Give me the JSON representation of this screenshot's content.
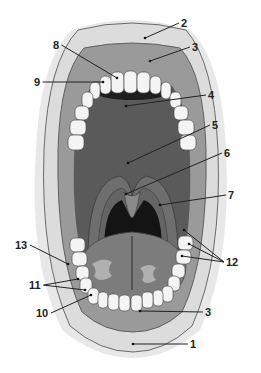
{
  "diagram": {
    "labels": [
      {
        "id": "1",
        "text": "1",
        "x": 190,
        "y": 348,
        "target_x": 133,
        "target_y": 344
      },
      {
        "id": "2",
        "text": "2",
        "x": 181,
        "y": 27,
        "target_x": 145,
        "target_y": 38
      },
      {
        "id": "3a",
        "text": "3",
        "x": 192,
        "y": 51,
        "target_x": 150,
        "target_y": 61
      },
      {
        "id": "3b",
        "text": "3",
        "x": 205,
        "y": 316,
        "target_x": 140,
        "target_y": 311
      },
      {
        "id": "4",
        "text": "4",
        "x": 208,
        "y": 99,
        "target_x": 126,
        "target_y": 106
      },
      {
        "id": "5",
        "text": "5",
        "x": 212,
        "y": 129,
        "target_x": 128,
        "target_y": 163
      },
      {
        "id": "6",
        "text": "6",
        "x": 224,
        "y": 157,
        "target_x": 126,
        "target_y": 194
      },
      {
        "id": "7",
        "text": "7",
        "x": 228,
        "y": 199,
        "target_x": 160,
        "target_y": 205
      },
      {
        "id": "8",
        "text": "8",
        "x": 53,
        "y": 49,
        "target_x": 117,
        "target_y": 78
      },
      {
        "id": "9",
        "text": "9",
        "x": 34,
        "y": 86,
        "target_x": 103,
        "target_y": 82
      },
      {
        "id": "10",
        "text": "10",
        "x": 36,
        "y": 317,
        "target_x": 91,
        "target_y": 295
      },
      {
        "id": "11",
        "text": "11",
        "x": 29,
        "y": 289,
        "target_x": 78,
        "target_y": 279
      },
      {
        "id": "12",
        "text": "12",
        "x": 226,
        "y": 266,
        "target_x": 189,
        "target_y": 244
      },
      {
        "id": "13",
        "text": "13",
        "x": 15,
        "y": 249,
        "target_x": 68,
        "target_y": 264
      }
    ],
    "colors": {
      "lip": "#dcdcdc",
      "lip_outline": "#6a6a6a",
      "gum": "#9a9a9a",
      "palate": "#5a5a5a",
      "throat": "#141414",
      "tongue": "#7c7c7c",
      "tongue_highlight": "#b0b0b0",
      "tooth": "#f4f4f4",
      "tooth_outline": "#555555",
      "label_text": "#222222"
    }
  }
}
